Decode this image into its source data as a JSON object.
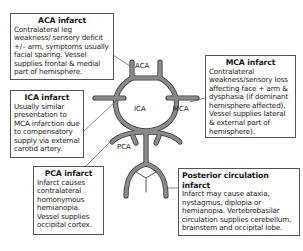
{
  "diagram": {
    "vessel_labels": {
      "aca": "ACA",
      "ica": "ICA",
      "mca": "MCA",
      "pca": "PCA"
    },
    "vessel_color": "#6e6e6e",
    "boxes": {
      "aca": {
        "title": "ACA infarct",
        "body": "Contralateral leg weakness/ sensory deficit +/– arm, symptoms usually facial sparing. Vessel supplies frontal & medial part of hemisphere."
      },
      "ica": {
        "title": "ICA infarct",
        "body": "Usually similar presentation to MCA infarction due to compensatory supply via external carotid artery."
      },
      "pca": {
        "title": "PCA infarct",
        "body": "Infarct causes contralateral homonymous hemianopia. Vessel supplies occipital cortex."
      },
      "mca": {
        "title": "MCA infarct",
        "body": "Contralateral weakness/sensory loss affecting face + arm & dysphasia (if dominant hemisphere affected). Vessel supplies lateral & external part of hemisphere)."
      },
      "posterior": {
        "title": "Posterior circulation infarct",
        "body": "Infarct may cause ataxia, nystagmus, diplopia or hemianopia. Vertebrobasilar circulation supplies cerebellum, brainstem and occipital lobe."
      }
    }
  }
}
